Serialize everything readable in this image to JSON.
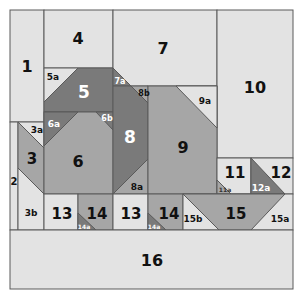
{
  "diagram": {
    "colors": {
      "light": "#e3e3e3",
      "medium": "#a6a6a6",
      "dark": "#7a7a7a",
      "line": "#5a5a5a",
      "text_dark": "#111111",
      "text_light": "#ffffff"
    },
    "pieces": [
      {
        "id": "1",
        "label": "1"
      },
      {
        "id": "2",
        "label": "2"
      },
      {
        "id": "3",
        "label": "3"
      },
      {
        "id": "3a",
        "label": "3a"
      },
      {
        "id": "3b",
        "label": "3b"
      },
      {
        "id": "4",
        "label": "4"
      },
      {
        "id": "5",
        "label": "5"
      },
      {
        "id": "5a",
        "label": "5a"
      },
      {
        "id": "6",
        "label": "6"
      },
      {
        "id": "6a",
        "label": "6a"
      },
      {
        "id": "6b",
        "label": "6b"
      },
      {
        "id": "7",
        "label": "7"
      },
      {
        "id": "7a",
        "label": "7a"
      },
      {
        "id": "8",
        "label": "8"
      },
      {
        "id": "8a",
        "label": "8a"
      },
      {
        "id": "8b",
        "label": "8b"
      },
      {
        "id": "9",
        "label": "9"
      },
      {
        "id": "9a",
        "label": "9a"
      },
      {
        "id": "10",
        "label": "10"
      },
      {
        "id": "11",
        "label": "11"
      },
      {
        "id": "11a",
        "label": "11a"
      },
      {
        "id": "12",
        "label": "12"
      },
      {
        "id": "12a",
        "label": "12a"
      },
      {
        "id": "13_left",
        "label": "13"
      },
      {
        "id": "14_left",
        "label": "14"
      },
      {
        "id": "14a_left",
        "label": "14a"
      },
      {
        "id": "13_right",
        "label": "13"
      },
      {
        "id": "14_right",
        "label": "14"
      },
      {
        "id": "14a_right",
        "label": "14a"
      },
      {
        "id": "15",
        "label": "15"
      },
      {
        "id": "15a",
        "label": "15a"
      },
      {
        "id": "15b",
        "label": "15b"
      },
      {
        "id": "16",
        "label": "16"
      }
    ]
  }
}
